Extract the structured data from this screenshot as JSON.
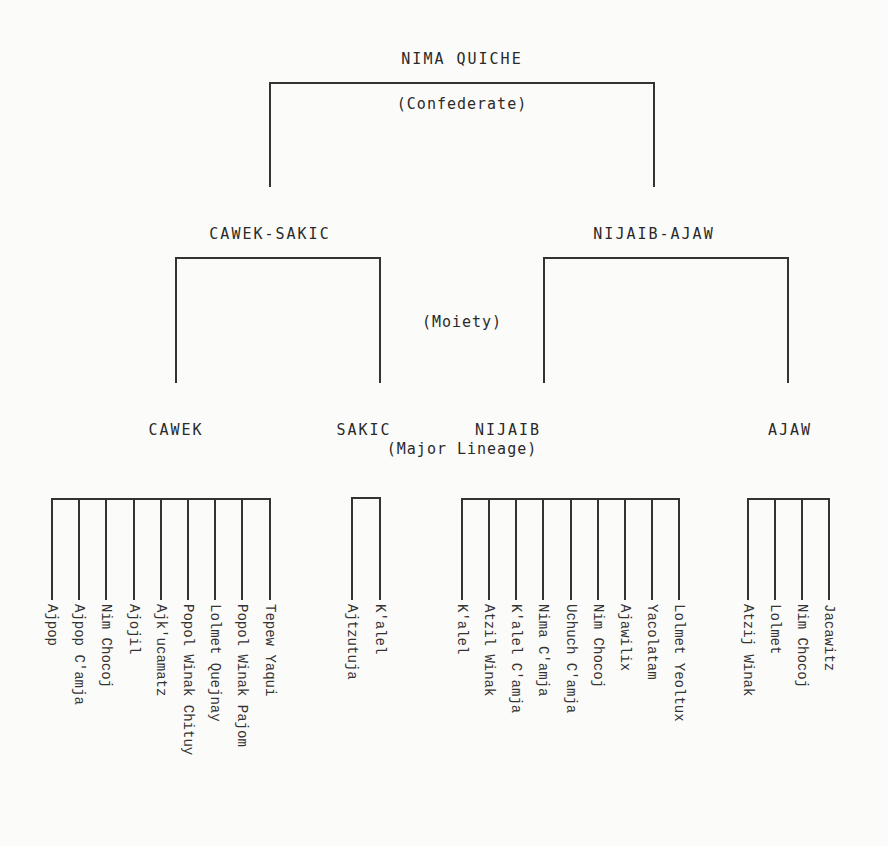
{
  "diagram": {
    "root": {
      "label": "NIMA QUICHE",
      "level_label": "(Confederate)"
    },
    "moiety_level_label": "(Moiety)",
    "lineage_level_label": "(Major Lineage)",
    "moieties": [
      {
        "label": "CAWEK-SAKIC"
      },
      {
        "label": "NIJAIB-AJAW"
      }
    ],
    "lineages": [
      {
        "label": "CAWEK",
        "sublineages": [
          "Ajpop",
          "Ajpop C'amja",
          "Nim Chocoj",
          "Ajojil",
          "Ajk'ucamatz",
          "Popol Winak Chituy",
          "Lolmet Quejnay",
          "Popol Winak Pajom",
          "Tepew Yaqui"
        ]
      },
      {
        "label": "SAKIC",
        "sublineages": [
          "Ajtzutuja",
          "K'alel"
        ]
      },
      {
        "label": "NIJAIB",
        "sublineages": [
          "K'alel",
          "Atzil Winak",
          "K'alel C'amja",
          "Nima C'amja",
          "Uchuch C'amja",
          "Nim Chocoj",
          "Ajawilix",
          "Yacolatam",
          "Lolmet Yeoltux"
        ]
      },
      {
        "label": "AJAW",
        "sublineages": [
          "Atzij Winak",
          "Lolmet",
          "Nim Chocoj",
          "Jacawitz"
        ]
      }
    ]
  }
}
